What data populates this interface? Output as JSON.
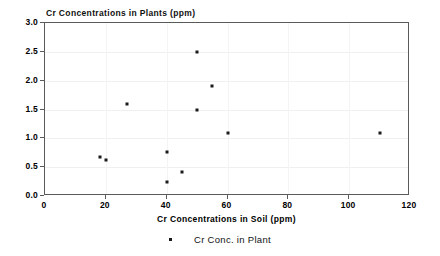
{
  "chart_data": {
    "type": "scatter",
    "title": "Cr Concentrations in Plants (ppm)",
    "xlabel": "Cr Concentrations in Soil (ppm)",
    "ylabel": "",
    "xlim": [
      0,
      120
    ],
    "ylim": [
      0.0,
      3.0
    ],
    "xticks": [
      "0",
      "20",
      "40",
      "60",
      "80",
      "100",
      "120"
    ],
    "xtick_values": [
      0,
      20,
      40,
      60,
      80,
      100,
      120
    ],
    "yticks": [
      "0.0",
      "0.5",
      "1.0",
      "1.5",
      "2.0",
      "2.5",
      "3.0"
    ],
    "ytick_values": [
      0.0,
      0.5,
      1.0,
      1.5,
      2.0,
      2.5,
      3.0
    ],
    "grid": true,
    "legend_position": "bottom-center",
    "marker_color": "#1a1a1a",
    "frame_color": "#5a5a5a",
    "series": [
      {
        "name": "Cr Conc. in Plant",
        "points": [
          {
            "x": 18,
            "y": 0.68
          },
          {
            "x": 20,
            "y": 0.62
          },
          {
            "x": 27,
            "y": 1.6
          },
          {
            "x": 40,
            "y": 0.76
          },
          {
            "x": 40,
            "y": 0.25
          },
          {
            "x": 45,
            "y": 0.41
          },
          {
            "x": 50,
            "y": 2.5
          },
          {
            "x": 50,
            "y": 1.5
          },
          {
            "x": 55,
            "y": 1.9
          },
          {
            "x": 60,
            "y": 1.1
          },
          {
            "x": 110,
            "y": 1.1
          }
        ]
      }
    ]
  },
  "legend": {
    "label": "Cr Conc. in Plant",
    "marker": "dot-marker"
  }
}
